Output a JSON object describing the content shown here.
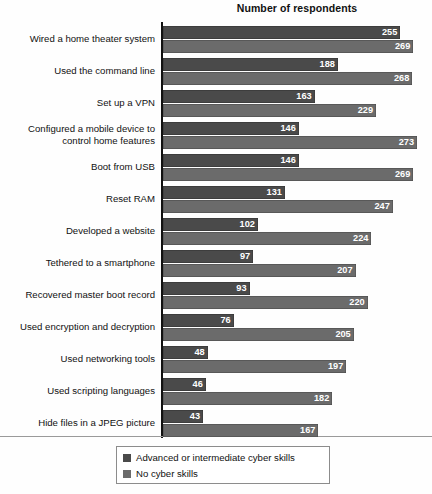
{
  "chart": {
    "title": "Number of respondents",
    "axis_label_left": ""
  },
  "legend": {
    "items": [
      {
        "label": "Advanced or intermediate cyber skills",
        "color": "#4a4a4a",
        "key": "advanced"
      },
      {
        "label": "No cyber skills",
        "color": "#6b6b6b",
        "key": "none"
      }
    ]
  },
  "chart_data": {
    "type": "bar",
    "orientation": "horizontal",
    "title": "Number of respondents",
    "xlabel": "Number of respondents",
    "ylabel": "",
    "xlim": [
      0,
      273
    ],
    "grid": false,
    "legend_position": "bottom",
    "categories": [
      "Wired a home theater system",
      "Used the command line",
      "Set up a VPN",
      "Configured a mobile device to control home features",
      "Boot from USB",
      "Reset RAM",
      "Developed a website",
      "Tethered to a smartphone",
      "Recovered master boot record",
      "Used encryption and decryption",
      "Used networking tools",
      "Used scripting languages",
      "Hide files in a JPEG picture"
    ],
    "series": [
      {
        "name": "Advanced or intermediate cyber skills",
        "color": "#4a4a4a",
        "values": [
          255,
          188,
          163,
          146,
          146,
          131,
          102,
          97,
          93,
          76,
          48,
          46,
          43
        ]
      },
      {
        "name": "No cyber skills",
        "color": "#6b6b6b",
        "values": [
          269,
          268,
          229,
          273,
          269,
          247,
          224,
          207,
          220,
          205,
          197,
          182,
          167
        ]
      }
    ]
  }
}
